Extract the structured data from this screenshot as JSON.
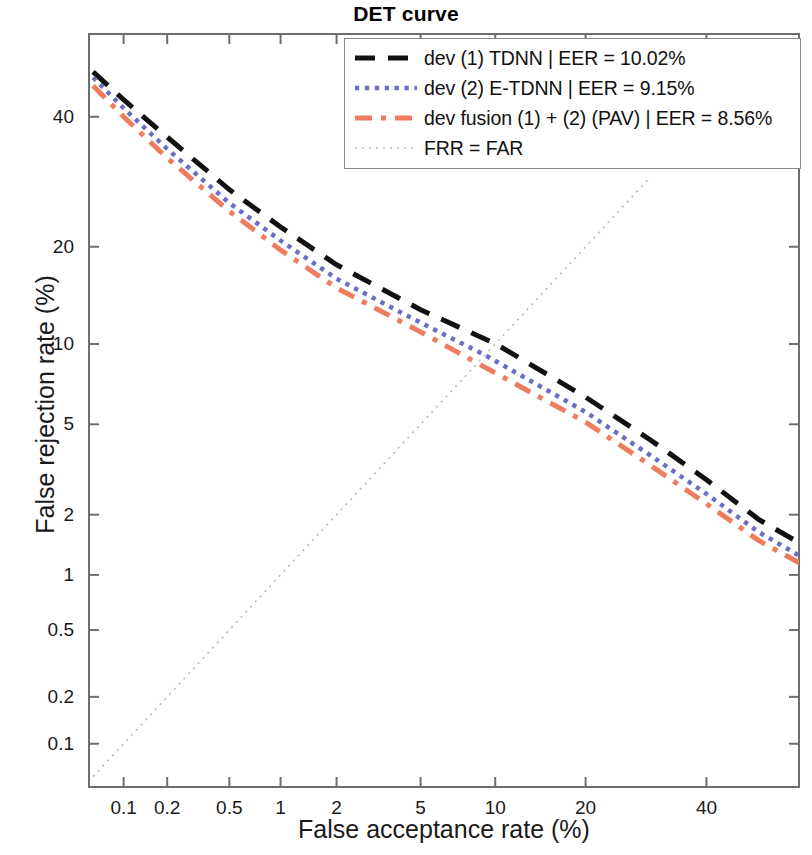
{
  "chart_data": {
    "type": "line",
    "title": "DET curve",
    "xlabel": "False acceptance rate (%)",
    "ylabel": "False rejection rate (%)",
    "axis_scale": "normal-deviate (probit)",
    "grid": false,
    "xticks": [
      0.1,
      0.2,
      0.5,
      1,
      2,
      5,
      10,
      20,
      40
    ],
    "xtick_labels": [
      "0.1",
      "0.2",
      "0.5",
      "1",
      "2",
      "5",
      "10",
      "20",
      "40"
    ],
    "yticks": [
      0.1,
      0.2,
      0.5,
      1,
      2,
      5,
      10,
      20,
      40
    ],
    "ytick_labels": [
      "0.1",
      "0.2",
      "0.5",
      "1",
      "2",
      "5",
      "10",
      "20",
      "40"
    ],
    "xlim": [
      0.055,
      58
    ],
    "ylim": [
      0.05,
      55
    ],
    "legend_position": "top-right",
    "series": [
      {
        "name": "dev (1) TDNN | EER = 10.02%",
        "eer": 10.02,
        "color": "#111111",
        "style": "dashed",
        "width": 5,
        "points": [
          [
            0.06,
            48.0
          ],
          [
            0.1,
            43.0
          ],
          [
            0.2,
            36.5
          ],
          [
            0.5,
            28.0
          ],
          [
            1,
            22.6
          ],
          [
            2,
            17.8
          ],
          [
            5,
            13.0
          ],
          [
            10.02,
            10.02
          ],
          [
            20,
            6.4
          ],
          [
            30,
            4.3
          ],
          [
            40,
            2.9
          ],
          [
            50,
            1.9
          ],
          [
            58,
            1.45
          ]
        ]
      },
      {
        "name": "dev (2)  E-TDNN  | EER = 9.15%",
        "eer": 9.15,
        "color": "#6b6fc4",
        "style": "dotted",
        "width": 4.5,
        "points": [
          [
            0.06,
            47.0
          ],
          [
            0.1,
            41.5
          ],
          [
            0.2,
            34.5
          ],
          [
            0.5,
            26.0
          ],
          [
            1,
            20.8
          ],
          [
            2,
            16.2
          ],
          [
            5,
            11.8
          ],
          [
            9.15,
            9.15
          ],
          [
            20,
            5.6
          ],
          [
            30,
            3.7
          ],
          [
            40,
            2.5
          ],
          [
            50,
            1.65
          ],
          [
            58,
            1.25
          ]
        ]
      },
      {
        "name": "dev fusion (1) + (2) (PAV) | EER = 8.56%",
        "eer": 8.56,
        "color": "#ed7d5e",
        "style": "dashdot",
        "width": 5,
        "points": [
          [
            0.06,
            45.5
          ],
          [
            0.1,
            40.0
          ],
          [
            0.2,
            33.0
          ],
          [
            0.5,
            24.8
          ],
          [
            1,
            19.6
          ],
          [
            2,
            15.2
          ],
          [
            5,
            11.0
          ],
          [
            8.56,
            8.56
          ],
          [
            20,
            5.1
          ],
          [
            30,
            3.35
          ],
          [
            40,
            2.25
          ],
          [
            50,
            1.5
          ],
          [
            58,
            1.15
          ]
        ]
      },
      {
        "name": "FRR = FAR",
        "color": "#b9b9b9",
        "style": "dotted-fine",
        "width": 1.6,
        "points": [
          [
            0.06,
            0.06
          ],
          [
            30,
            30
          ]
        ]
      }
    ]
  },
  "legend": {
    "entries": [
      {
        "label": "dev (1) TDNN | EER = 10.02%"
      },
      {
        "label": "dev (2)  E-TDNN  | EER = 9.15%"
      },
      {
        "label": "dev fusion (1) + (2) (PAV) | EER = 8.56%"
      },
      {
        "label": "FRR = FAR"
      }
    ]
  }
}
